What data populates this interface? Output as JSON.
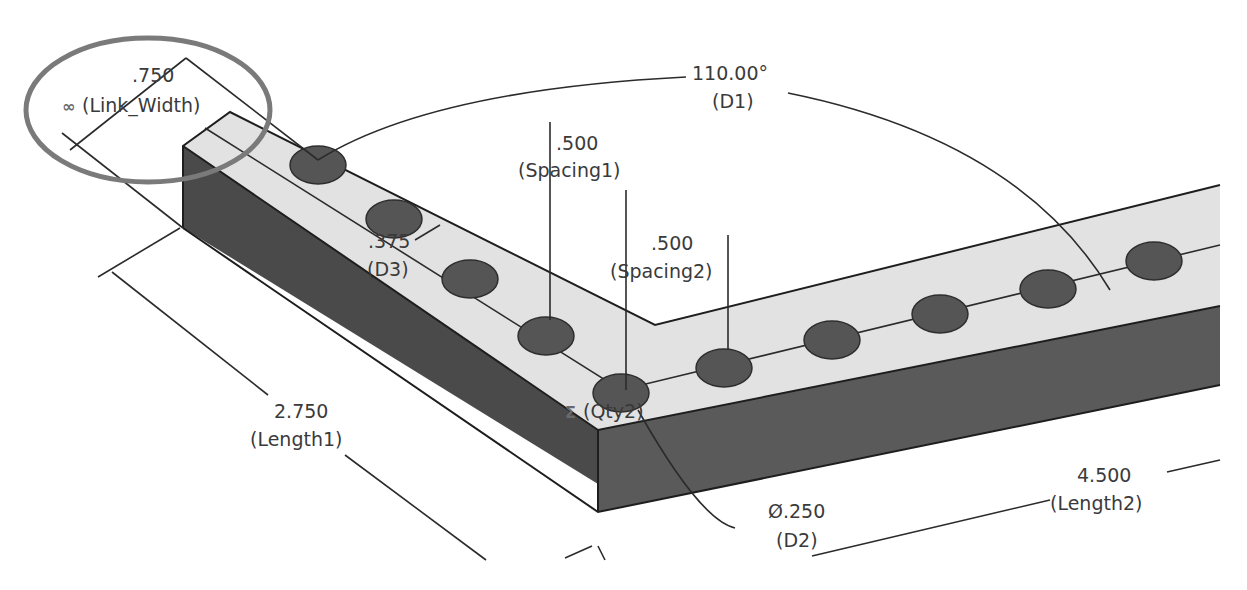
{
  "diagram": {
    "type": "cad-dimensioned-part",
    "colors": {
      "top_face": "#e2e2e2",
      "side_face": "#4a4a4a",
      "hole_fill": "#555555",
      "highlight_ring": "#7a7a7a",
      "dimension_text": "#3a3a3a"
    },
    "dimensions": {
      "link_width": {
        "value": ".750",
        "name": "(Link_Width)",
        "symbol": "∞"
      },
      "d1": {
        "value": "110.00°",
        "name": "(D1)"
      },
      "spacing1": {
        "value": ".500",
        "name": "(Spacing1)"
      },
      "spacing2": {
        "value": ".500",
        "name": "(Spacing2)"
      },
      "d3": {
        "value": ".375",
        "name": "(D3)"
      },
      "qty": {
        "value": "",
        "name": "(Qty2)",
        "symbol": "Σ"
      },
      "length1": {
        "value": "2.750",
        "name": "(Length1)"
      },
      "length2": {
        "value": "4.500",
        "name": "(Length2)"
      },
      "d2": {
        "value": "Ø.250",
        "name": "(D2)"
      }
    }
  }
}
